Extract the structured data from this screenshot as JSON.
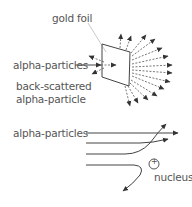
{
  "top_diagram": {
    "title": "Gold foil scattering experiment",
    "labels": {
      "gold_foil": "gold foil",
      "alpha_particles": "alpha-particles",
      "back_scattered_line1": "back-scattered",
      "back_scattered_line2": "alpha-particle"
    }
  },
  "bottom_diagram": {
    "title": "Alpha particle paths near nucleus",
    "labels": {
      "alpha_particles": "alpha-particles",
      "nucleus": "nucleus",
      "nucleus_charge": "+"
    }
  },
  "colors": {
    "line": "#444444",
    "dashed": "#555555",
    "text": "#555555",
    "leader": "#bbbbbb"
  }
}
